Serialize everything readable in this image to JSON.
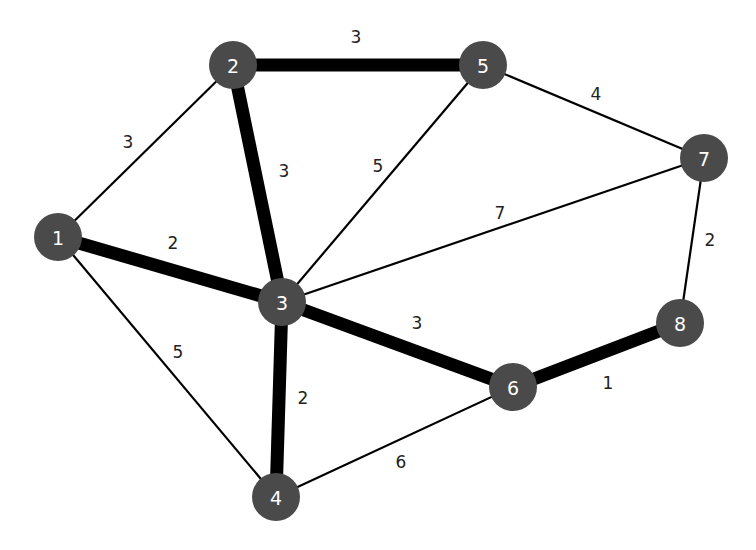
{
  "diagram": {
    "type": "weighted-undirected-graph",
    "colors": {
      "node_fill": "#4a4a4a",
      "node_text": "#ffffff",
      "edge": "#000000",
      "background": "#ffffff"
    },
    "nodes": [
      {
        "id": "1",
        "label": "1",
        "x": 58,
        "y": 237
      },
      {
        "id": "2",
        "label": "2",
        "x": 233,
        "y": 65
      },
      {
        "id": "3",
        "label": "3",
        "x": 282,
        "y": 302
      },
      {
        "id": "4",
        "label": "4",
        "x": 276,
        "y": 497
      },
      {
        "id": "5",
        "label": "5",
        "x": 483,
        "y": 65
      },
      {
        "id": "6",
        "label": "6",
        "x": 513,
        "y": 387
      },
      {
        "id": "7",
        "label": "7",
        "x": 704,
        "y": 158
      },
      {
        "id": "8",
        "label": "8",
        "x": 680,
        "y": 323
      }
    ],
    "edges": [
      {
        "from": "1",
        "to": "2",
        "weight": "3",
        "highlighted": false,
        "lx": 128,
        "ly": 142
      },
      {
        "from": "1",
        "to": "3",
        "weight": "2",
        "highlighted": true,
        "lx": 173,
        "ly": 243
      },
      {
        "from": "1",
        "to": "4",
        "weight": "5",
        "highlighted": false,
        "lx": 178,
        "ly": 352
      },
      {
        "from": "2",
        "to": "5",
        "weight": "3",
        "highlighted": true,
        "lx": 356,
        "ly": 37
      },
      {
        "from": "2",
        "to": "3",
        "weight": "3",
        "highlighted": true,
        "lx": 284,
        "ly": 171
      },
      {
        "from": "3",
        "to": "5",
        "weight": "5",
        "highlighted": false,
        "lx": 378,
        "ly": 166
      },
      {
        "from": "3",
        "to": "7",
        "weight": "7",
        "highlighted": false,
        "lx": 500,
        "ly": 213
      },
      {
        "from": "3",
        "to": "6",
        "weight": "3",
        "highlighted": true,
        "lx": 417,
        "ly": 323
      },
      {
        "from": "3",
        "to": "4",
        "weight": "2",
        "highlighted": true,
        "lx": 303,
        "ly": 398
      },
      {
        "from": "4",
        "to": "6",
        "weight": "6",
        "highlighted": false,
        "lx": 401,
        "ly": 462
      },
      {
        "from": "5",
        "to": "7",
        "weight": "4",
        "highlighted": false,
        "lx": 596,
        "ly": 94
      },
      {
        "from": "7",
        "to": "8",
        "weight": "2",
        "highlighted": false,
        "lx": 710,
        "ly": 240
      },
      {
        "from": "6",
        "to": "8",
        "weight": "1",
        "highlighted": true,
        "lx": 608,
        "ly": 383
      }
    ]
  }
}
